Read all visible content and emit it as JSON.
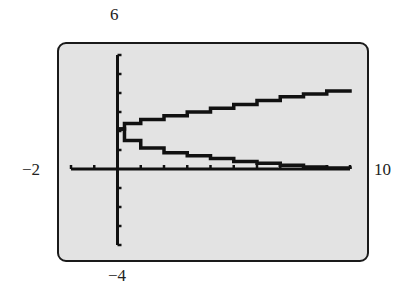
{
  "chart_data": {
    "type": "line",
    "title": "",
    "xlabel": "",
    "ylabel": "",
    "xlim": [
      -2,
      10
    ],
    "ylim": [
      -4,
      6
    ],
    "x_tick_step": 1,
    "y_tick_step": 1,
    "grid": false,
    "window_labels": {
      "ymax": "6",
      "ymin": "−4",
      "xmin": "−2",
      "xmax": "10"
    },
    "series": [
      {
        "name": "upper branch",
        "points": [
          [
            0,
            2.1
          ],
          [
            0.3,
            2.4
          ],
          [
            1,
            2.6
          ],
          [
            2,
            2.8
          ],
          [
            3,
            3.0
          ],
          [
            4,
            3.2
          ],
          [
            5,
            3.4
          ],
          [
            6,
            3.6
          ],
          [
            7,
            3.8
          ],
          [
            8,
            3.95
          ],
          [
            9,
            4.1
          ],
          [
            10,
            4.2
          ]
        ]
      },
      {
        "name": "lower branch",
        "points": [
          [
            0,
            2.1
          ],
          [
            0.3,
            1.5
          ],
          [
            1,
            1.1
          ],
          [
            2,
            0.85
          ],
          [
            3,
            0.7
          ],
          [
            4,
            0.55
          ],
          [
            5,
            0.4
          ],
          [
            6,
            0.3
          ],
          [
            7,
            0.2
          ],
          [
            8,
            0.1
          ],
          [
            9,
            0.05
          ],
          [
            10,
            0.0
          ]
        ]
      }
    ]
  }
}
